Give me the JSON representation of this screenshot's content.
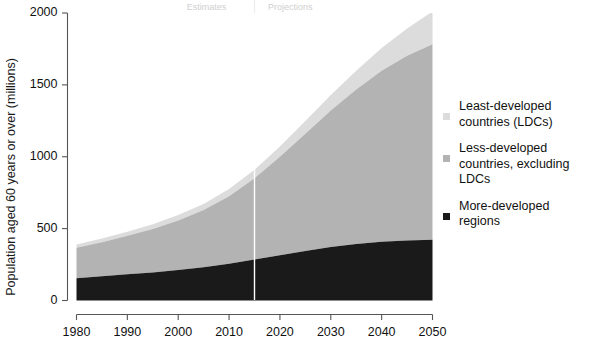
{
  "chart_data": {
    "type": "area",
    "title": "",
    "subtitle": "",
    "xlabel": "",
    "ylabel": "Population aged 60 years or over (millions)",
    "xlim": [
      1980,
      2050
    ],
    "ylim": [
      0,
      2000
    ],
    "xticks": [
      1980,
      1990,
      2000,
      2010,
      2020,
      2030,
      2040,
      2050
    ],
    "yticks": [
      0,
      500,
      1000,
      1500,
      2000
    ],
    "xticklabels": [
      "1980",
      "1990",
      "2000",
      "2010",
      "2020",
      "2030",
      "2040",
      "2050"
    ],
    "yticklabels": [
      "0",
      "500",
      "1000",
      "1500",
      "2000"
    ],
    "grid": false,
    "stacked": true,
    "legend_position": "right",
    "x": [
      1980,
      1985,
      1990,
      1995,
      2000,
      2005,
      2010,
      2015,
      2020,
      2025,
      2030,
      2035,
      2040,
      2045,
      2050
    ],
    "series": [
      {
        "name": "More-developed regions",
        "color": "#1a1a1a",
        "values": [
          155,
          169,
          182,
          195,
          212,
          231,
          255,
          285,
          315,
          345,
          372,
          393,
          408,
          417,
          422
        ]
      },
      {
        "name": "Less-developed countries, excluding LDCs",
        "color": "#b3b3b3",
        "values": [
          212,
          237,
          268,
          303,
          345,
          398,
          470,
          565,
          685,
          815,
          950,
          1075,
          1190,
          1285,
          1360
        ]
      },
      {
        "name": "Least-developed countries (LDCs)",
        "color": "#dcdcdc",
        "values": [
          22,
          25,
          28,
          32,
          37,
          43,
          50,
          60,
          72,
          88,
          107,
          130,
          158,
          190,
          228
        ]
      }
    ],
    "series_totals": [
      389,
      431,
      478,
      530,
      594,
      672,
      775,
      910,
      1072,
      1248,
      1429,
      1598,
      1756,
      1892,
      2010
    ],
    "annotations": [
      {
        "text": "Estimates",
        "x": 2006,
        "color": "#cfcfcf"
      },
      {
        "text": "Projections",
        "x": 2022,
        "color": "#cfcfcf"
      }
    ],
    "divider": {
      "x": 2015,
      "color": "#ffffff"
    }
  },
  "axis": {
    "ylabel": "Population aged 60 years or over (millions)"
  },
  "legend": {
    "items": [
      {
        "line1": "Least-developed",
        "line2": "countries (LDCs)",
        "color": "#dcdcdc"
      },
      {
        "line1": "Less-developed",
        "line2": "countries, excluding LDCs",
        "color": "#b3b3b3"
      },
      {
        "line1": "More-developed",
        "line2": "regions",
        "color": "#1a1a1a"
      }
    ]
  },
  "periods": {
    "estimates": "Estimates",
    "projections": "Projections"
  }
}
